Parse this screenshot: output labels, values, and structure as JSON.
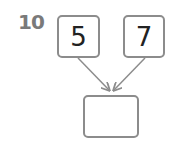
{
  "problem": {
    "number": "10",
    "inputs": [
      "5",
      "7"
    ],
    "answer": ""
  },
  "colors": {
    "border": "#8c8c8c",
    "arrow": "#8c8c8c",
    "number": "#7a7a7a"
  }
}
